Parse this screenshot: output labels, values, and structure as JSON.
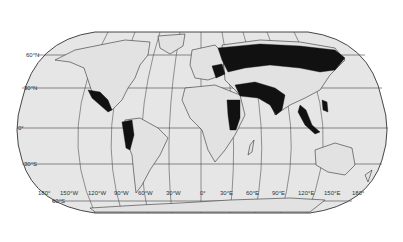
{
  "map": {
    "projection": "Robinson-like world map",
    "style": {
      "ocean": "#e6e6e6",
      "land": "#e2e2e2",
      "outline": "#333333",
      "highlight": "#111111",
      "grid": "#444444"
    },
    "latitude_labels": [
      {
        "label": "60°N",
        "y": 55
      },
      {
        "label": "30°N",
        "y": 88
      },
      {
        "label": "0°",
        "y": 128
      },
      {
        "label": "30°S",
        "y": 164
      },
      {
        "label": "60°S",
        "y": 201
      }
    ],
    "longitude_labels": [
      "180°",
      "150°W",
      "120°W",
      "90°W",
      "60°W",
      "30°W",
      "0°",
      "30°E",
      "60°E",
      "90°E",
      "120°E",
      "150°E",
      "180°"
    ],
    "highlighted_regions": [
      "Mexico / Central America",
      "Western South America (Colombia, Ecuador, Peru)",
      "Russia / Northern Eurasia",
      "Eastern Europe",
      "Middle East to India",
      "East Africa (Sudan, Uganda, Kenya, Tanzania)",
      "Southeast Asia (Myanmar, Malaysia, Indonesia, Philippines)"
    ]
  }
}
